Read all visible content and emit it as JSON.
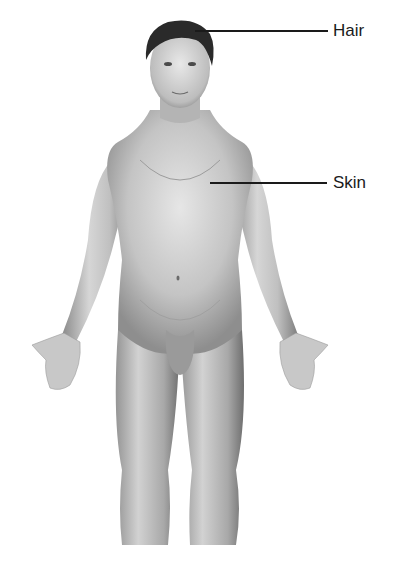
{
  "diagram": {
    "labels": [
      {
        "text": "Hair",
        "target": "hair"
      },
      {
        "text": "Skin",
        "target": "skin"
      }
    ]
  },
  "colors": {
    "background": "#ffffff",
    "line": "#1a1a1a",
    "skin_light": "#e4e4e4",
    "skin_mid": "#b8b8b8",
    "skin_dark": "#7a7a7a",
    "hair": "#2a2a2a"
  }
}
